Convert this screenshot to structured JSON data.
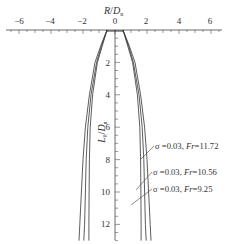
{
  "chart_data": {
    "type": "line",
    "title": "",
    "xlabel": "R/D_n",
    "ylabel": "L_k/D_n",
    "x_ticks": [
      -6,
      -4,
      -2,
      0,
      2,
      4,
      6
    ],
    "y_ticks": [
      2,
      4,
      6,
      8,
      10,
      12
    ],
    "xlim": [
      -6.6,
      6.6
    ],
    "ylim": [
      0,
      13
    ],
    "x_axis_position": "top",
    "y_axis_inverted": true,
    "grid": false,
    "series": [
      {
        "name": "σ=0.03, Fr=11.72",
        "sigma": 0.03,
        "Fr": 11.72,
        "profile": [
          [
            0,
            0.5
          ],
          [
            1,
            0.9
          ],
          [
            2,
            1.25
          ],
          [
            4,
            1.6
          ],
          [
            6,
            1.85
          ],
          [
            8,
            2.0
          ],
          [
            10,
            2.1
          ],
          [
            12,
            2.2
          ],
          [
            13,
            2.25
          ]
        ]
      },
      {
        "name": "σ=0.03, Fr=10.56",
        "sigma": 0.03,
        "Fr": 10.56,
        "profile": [
          [
            0,
            0.5
          ],
          [
            1,
            0.85
          ],
          [
            2,
            1.15
          ],
          [
            4,
            1.5
          ],
          [
            6,
            1.7
          ],
          [
            8,
            1.8
          ],
          [
            10,
            1.85
          ],
          [
            12,
            1.9
          ],
          [
            13,
            1.95
          ]
        ]
      },
      {
        "name": "σ=0.03, Fr=9.25",
        "sigma": 0.03,
        "Fr": 9.25,
        "profile": [
          [
            0,
            0.5
          ],
          [
            1,
            0.8
          ],
          [
            2,
            1.1
          ],
          [
            4,
            1.4
          ],
          [
            6,
            1.55
          ],
          [
            8,
            1.6
          ],
          [
            10,
            1.62
          ],
          [
            12,
            1.63
          ],
          [
            13,
            1.63
          ]
        ]
      }
    ],
    "legend_position": "right, annotations with leader lines"
  },
  "labels": {
    "xlabel_main": "R",
    "xlabel_sep": "/",
    "xlabel_den": "D",
    "xlabel_sub": "n",
    "ylabel_main": "L",
    "ylabel_sub1": "k",
    "ylabel_sep": "/",
    "ylabel_den": "D",
    "ylabel_sub2": "n",
    "x_tick_text": [
      "−6",
      "−4",
      "−2",
      "0",
      "2",
      "4",
      "6"
    ],
    "y_tick_text": [
      "2",
      "4",
      "6",
      "8",
      "10",
      "12"
    ],
    "legend": [
      {
        "sigma": "σ =0.03, ",
        "fr": "Fr",
        "val": "=11.72"
      },
      {
        "sigma": "σ =0.03, ",
        "fr": "Fr",
        "val": "=10.56"
      },
      {
        "sigma": "σ =0.03, ",
        "fr": "Fr",
        "val": "=9.25"
      }
    ]
  }
}
